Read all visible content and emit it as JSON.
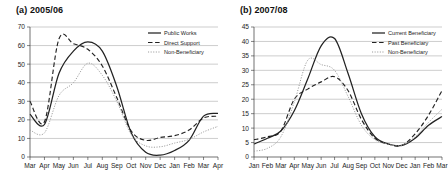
{
  "figure": {
    "background": "#ffffff",
    "panel_count": 2
  },
  "panels": [
    {
      "id": "panel-a",
      "title": "(a) 2005/06"
    },
    {
      "id": "panel-b",
      "title": "(b) 2007/08"
    }
  ],
  "chart_data": [
    {
      "type": "line",
      "title": "(a) 2005/06",
      "xlabel": "",
      "ylabel": "",
      "ylim": [
        0,
        70
      ],
      "yticks": [
        0,
        10,
        20,
        30,
        40,
        50,
        60,
        70
      ],
      "grid": true,
      "legend_position": "top-right",
      "categories": [
        "Mar",
        "Apr",
        "May",
        "Jun",
        "Jul",
        "Aug",
        "Sep",
        "Oct",
        "Nov",
        "Dec",
        "Jan",
        "Feb",
        "Mar",
        "Apr"
      ],
      "series": [
        {
          "name": "Public Works",
          "style": "solid",
          "color": "#222222",
          "values": [
            23.0,
            17.5,
            45.0,
            57.0,
            62.0,
            57.0,
            38.0,
            13.0,
            2.5,
            1.0,
            3.5,
            9.0,
            22.0,
            23.5
          ]
        },
        {
          "name": "Direct Support",
          "style": "dashed",
          "color": "#222222",
          "values": [
            30.0,
            19.0,
            63.5,
            61.0,
            58.0,
            49.0,
            32.0,
            14.0,
            9.0,
            10.5,
            11.5,
            14.5,
            21.0,
            22.0
          ]
        },
        {
          "name": "Non-Beneficiary",
          "style": "dotted",
          "color": "#9b9b9b",
          "values": [
            14.5,
            13.0,
            33.0,
            40.0,
            50.5,
            44.0,
            30.0,
            12.0,
            6.0,
            5.5,
            7.5,
            9.5,
            13.5,
            16.5
          ]
        }
      ]
    },
    {
      "type": "line",
      "title": "(b) 2007/08",
      "xlabel": "",
      "ylabel": "",
      "ylim": [
        0,
        45
      ],
      "yticks": [
        0,
        5,
        10,
        15,
        20,
        25,
        30,
        35,
        40,
        45
      ],
      "grid": true,
      "legend_position": "top-right",
      "categories": [
        "Jan",
        "Feb",
        "Mar",
        "Apr",
        "May",
        "Jun",
        "Jul",
        "Aug",
        "Sep",
        "Oct",
        "Nov",
        "Dec",
        "Jan",
        "Feb",
        "Mar"
      ],
      "series": [
        {
          "name": "Current Beneficiary",
          "style": "solid",
          "color": "#222222",
          "values": [
            4.5,
            6.5,
            9.0,
            16.0,
            27.0,
            38.5,
            41.0,
            29.0,
            15.0,
            7.0,
            4.5,
            4.0,
            6.5,
            11.0,
            14.0
          ]
        },
        {
          "name": "Past Beneficiary",
          "style": "dashed",
          "color": "#222222",
          "values": [
            6.0,
            7.0,
            9.0,
            20.0,
            23.5,
            26.0,
            27.8,
            23.0,
            13.0,
            6.5,
            4.5,
            4.0,
            8.0,
            14.5,
            23.0
          ]
        },
        {
          "name": "Non-Beneficiary",
          "style": "dotted",
          "color": "#9b9b9b",
          "values": [
            2.0,
            3.0,
            7.0,
            19.0,
            33.5,
            32.0,
            30.0,
            21.0,
            11.0,
            6.0,
            4.5,
            4.0,
            7.0,
            12.0,
            16.5
          ]
        }
      ]
    }
  ]
}
